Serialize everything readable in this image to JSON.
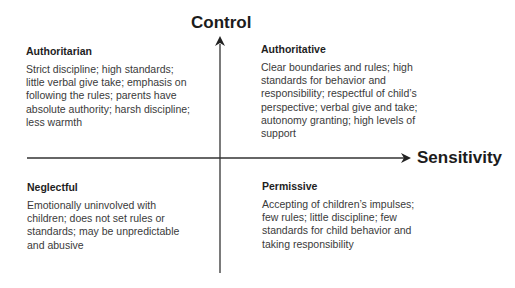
{
  "axes": {
    "vertical": {
      "label": "Control"
    },
    "horizontal": {
      "label": "Sensitivity"
    },
    "line_color": "#333333"
  },
  "quadrants": {
    "top_left": {
      "title": "Authoritarian",
      "lines": [
        "Strict discipline; high standards;",
        "little verbal give take; emphasis on",
        "following the rules; parents have",
        "absolute authority; harsh discipline;",
        "less warmth"
      ]
    },
    "top_right": {
      "title": "Authoritative",
      "lines": [
        "Clear boundaries and rules; high",
        "standards for behavior and",
        "responsibility; respectful of child’s",
        "perspective; verbal give and take;",
        "autonomy granting; high levels of",
        "support"
      ]
    },
    "bottom_left": {
      "title": "Neglectful",
      "lines": [
        "Emotionally uninvolved with",
        "children; does not set rules or",
        "standards; may be unpredictable",
        "and abusive"
      ]
    },
    "bottom_right": {
      "title": "Permissive",
      "lines": [
        "Accepting of children’s impulses;",
        "few rules; little discipline; few",
        "standards for child behavior and",
        "taking responsibility"
      ]
    }
  }
}
